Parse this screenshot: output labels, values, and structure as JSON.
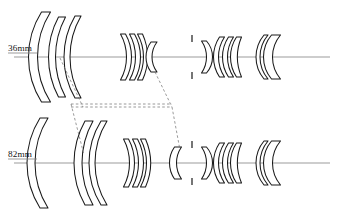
{
  "figure": {
    "kind": "optical-lens-cross-section",
    "background_color": "#ffffff",
    "outline_color": "#1a1a1a",
    "axis_color": "#8a8a8a",
    "motion_line_color": "#6e6e6e",
    "width": 338,
    "height": 209
  },
  "rows": [
    {
      "id": "wide",
      "label": "36mm",
      "label_x": 8,
      "label_y": 51,
      "axis_y": 57,
      "axis_x1": 14,
      "axis_x2": 330,
      "underline": {
        "x1": 8,
        "x2": 37,
        "y": 53
      },
      "groups": [
        {
          "name": "front-group",
          "elements": [
            {
              "name": "element-1-meniscus",
              "cx": 46,
              "half_height": 45,
              "thickness": 9,
              "front_curve": 13,
              "back_curve": 13,
              "shape": "meniscus-front"
            },
            {
              "name": "element-2-meniscus",
              "cx": 62,
              "half_height": 40,
              "thickness": 7,
              "front_curve": 10,
              "back_curve": 10,
              "shape": "meniscus-front"
            },
            {
              "name": "element-3-meniscus",
              "cx": 78,
              "half_height": 41,
              "thickness": 6,
              "front_curve": 11,
              "back_curve": 11,
              "shape": "meniscus-front"
            }
          ]
        },
        {
          "name": "second-group",
          "elements": [
            {
              "name": "element-4-biconcave",
              "cx": 123,
              "half_height": 23,
              "thickness": 5,
              "front_curve": -6,
              "back_curve": -6,
              "shape": "biconcave"
            },
            {
              "name": "element-5-biconcave",
              "cx": 132,
              "half_height": 23,
              "thickness": 5,
              "front_curve": -6,
              "back_curve": -6,
              "shape": "biconcave"
            },
            {
              "name": "element-6-meniscus",
              "cx": 140,
              "half_height": 23,
              "thickness": 5,
              "front_curve": -6,
              "back_curve": -5,
              "shape": "meniscus-back"
            }
          ]
        },
        {
          "name": "third-group",
          "elements": [
            {
              "name": "element-7-biconvex",
              "cx": 154,
              "half_height": 15,
              "thickness": 6,
              "front_curve": 5,
              "back_curve": 5,
              "shape": "biconvex"
            }
          ]
        }
      ],
      "aperture_stop": {
        "name": "aperture-stop",
        "x": 192,
        "half_height": 22,
        "blade_length": 7
      },
      "rear_groups": [
        {
          "name": "rear-group-1",
          "elements": [
            {
              "name": "element-8-meniscus",
              "cx": 204,
              "half_height": 16,
              "thickness": 5,
              "front_curve": -5,
              "back_curve": -6,
              "shape": "meniscus-back"
            }
          ]
        },
        {
          "name": "rear-group-2",
          "elements": [
            {
              "name": "element-9-biconvex",
              "cx": 222,
              "half_height": 20,
              "thickness": 5,
              "front_curve": 6,
              "back_curve": 6,
              "shape": "biconvex"
            },
            {
              "name": "element-10-biconvex",
              "cx": 231,
              "half_height": 20,
              "thickness": 5,
              "front_curve": 6,
              "back_curve": 6,
              "shape": "biconvex"
            },
            {
              "name": "element-11-meniscus",
              "cx": 239,
              "half_height": 20,
              "thickness": 5,
              "front_curve": 6,
              "back_curve": 4,
              "shape": "meniscus-front"
            }
          ]
        },
        {
          "name": "rear-group-3",
          "elements": [
            {
              "name": "element-12-meniscus",
              "cx": 266,
              "half_height": 22,
              "thickness": 4,
              "front_curve": 8,
              "back_curve": 8,
              "shape": "meniscus-front"
            },
            {
              "name": "element-13-meniscus-thick",
              "cx": 276,
              "half_height": 22,
              "thickness": 9,
              "front_curve": 8,
              "back_curve": 8,
              "shape": "meniscus-front"
            }
          ]
        }
      ]
    },
    {
      "id": "tele",
      "label": "82mm",
      "label_x": 8,
      "label_y": 157,
      "axis_y": 163,
      "axis_x1": 14,
      "axis_x2": 330,
      "underline": {
        "x1": 8,
        "x2": 37,
        "y": 159
      },
      "groups": [
        {
          "name": "front-group",
          "elements": [
            {
              "name": "element-1-meniscus",
              "cx": 44,
              "half_height": 45,
              "thickness": 8,
              "front_curve": 13,
              "back_curve": 13,
              "shape": "meniscus-front"
            },
            {
              "name": "element-2-meniscus",
              "cx": 89,
              "half_height": 42,
              "thickness": 8,
              "front_curve": 11,
              "back_curve": 11,
              "shape": "meniscus-front"
            },
            {
              "name": "element-3-meniscus",
              "cx": 104,
              "half_height": 42,
              "thickness": 6,
              "front_curve": 12,
              "back_curve": 12,
              "shape": "meniscus-front"
            }
          ]
        },
        {
          "name": "second-group",
          "elements": [
            {
              "name": "element-4-biconcave",
              "cx": 126,
              "half_height": 24,
              "thickness": 5,
              "front_curve": -6,
              "back_curve": -6,
              "shape": "biconcave"
            },
            {
              "name": "element-5-biconcave",
              "cx": 135,
              "half_height": 24,
              "thickness": 5,
              "front_curve": -6,
              "back_curve": -6,
              "shape": "biconcave"
            },
            {
              "name": "element-6-meniscus",
              "cx": 143,
              "half_height": 24,
              "thickness": 5,
              "front_curve": -6,
              "back_curve": -5,
              "shape": "meniscus-back"
            }
          ]
        },
        {
          "name": "third-group",
          "elements": [
            {
              "name": "element-7-biconvex",
              "cx": 178,
              "half_height": 16,
              "thickness": 7,
              "front_curve": 5,
              "back_curve": 5,
              "shape": "biconvex"
            }
          ]
        }
      ],
      "aperture_stop": {
        "name": "aperture-stop",
        "x": 192,
        "half_height": 22,
        "blade_length": 7
      },
      "rear_groups": [
        {
          "name": "rear-group-1",
          "elements": [
            {
              "name": "element-8-meniscus",
              "cx": 204,
              "half_height": 16,
              "thickness": 5,
              "front_curve": -5,
              "back_curve": -6,
              "shape": "meniscus-back"
            }
          ]
        },
        {
          "name": "rear-group-2",
          "elements": [
            {
              "name": "element-9-biconvex",
              "cx": 222,
              "half_height": 20,
              "thickness": 5,
              "front_curve": 6,
              "back_curve": 6,
              "shape": "biconvex"
            },
            {
              "name": "element-10-biconvex",
              "cx": 231,
              "half_height": 20,
              "thickness": 5,
              "front_curve": 6,
              "back_curve": 6,
              "shape": "biconvex"
            },
            {
              "name": "element-11-meniscus",
              "cx": 239,
              "half_height": 20,
              "thickness": 5,
              "front_curve": 6,
              "back_curve": 4,
              "shape": "meniscus-front"
            }
          ]
        },
        {
          "name": "rear-group-3",
          "elements": [
            {
              "name": "element-12-meniscus",
              "cx": 266,
              "half_height": 22,
              "thickness": 4,
              "front_curve": 8,
              "back_curve": 8,
              "shape": "meniscus-front"
            },
            {
              "name": "element-13-meniscus-thick",
              "cx": 276,
              "half_height": 22,
              "thickness": 9,
              "front_curve": 8,
              "back_curve": 8,
              "shape": "meniscus-front"
            }
          ]
        }
      ]
    }
  ],
  "motion_lines": [
    {
      "name": "motion-front-group-upper",
      "x1": 60,
      "y1": 58,
      "x2": 83,
      "y2": 107
    },
    {
      "name": "motion-front-group-lower",
      "x1": 71,
      "y1": 104,
      "x2": 84,
      "y2": 155
    },
    {
      "name": "motion-second-group-upper",
      "x1": 155,
      "y1": 72,
      "x2": 172,
      "y2": 107
    },
    {
      "name": "motion-second-group-lower",
      "x1": 172,
      "y1": 107,
      "x2": 180,
      "y2": 150
    },
    {
      "name": "motion-bracket-top",
      "x1": 71,
      "y1": 104,
      "x2": 172,
      "y2": 104
    },
    {
      "name": "motion-bracket-bottom",
      "x1": 71,
      "y1": 107,
      "x2": 172,
      "y2": 107
    }
  ]
}
